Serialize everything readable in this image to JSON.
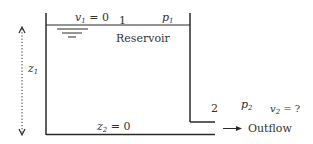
{
  "diagram": {
    "reservoir_label": "Reservoir",
    "point1": {
      "number": "1",
      "velocity_var": "v",
      "velocity_sub": "1",
      "velocity_value": "= 0",
      "pressure_var": "p",
      "pressure_sub": "1"
    },
    "point2": {
      "number": "2",
      "pressure_var": "p",
      "pressure_sub": "2",
      "velocity_var": "v",
      "velocity_sub": "2",
      "velocity_value": "= ?",
      "elevation_var": "z",
      "elevation_sub": "2",
      "elevation_value": "= 0"
    },
    "height": {
      "var": "z",
      "sub": "1"
    },
    "outflow_label": "Outflow",
    "colors": {
      "line": "#2a2a2a",
      "text": "#333333"
    }
  }
}
